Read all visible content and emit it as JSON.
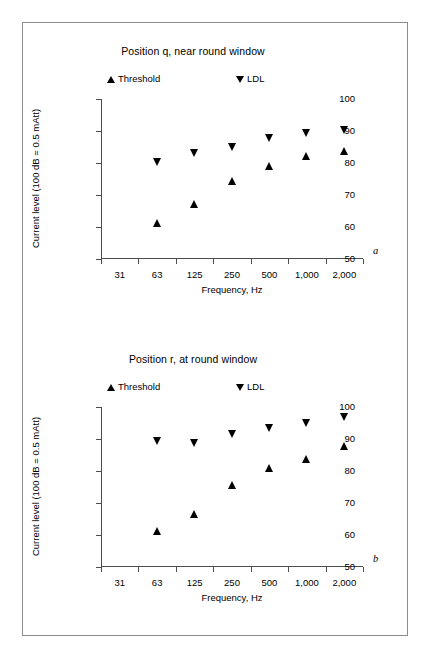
{
  "figure": {
    "background": "#ffffff",
    "frame_color": "#8c8c8c",
    "marker_color": "#000000"
  },
  "panels": [
    {
      "letter": "a",
      "title": "Position q, near round window",
      "legend": {
        "threshold": "Threshold",
        "ldl": "LDL"
      }
    },
    {
      "letter": "b",
      "title": "Position r, at round window",
      "legend": {
        "threshold": "Threshold",
        "ldl": "LDL"
      }
    }
  ],
  "axes": {
    "xlabel": "Frequency, Hz",
    "ylabel": "Current level (100 dB = 0.5 mAtt)",
    "xticklabels": [
      "31",
      "63",
      "125",
      "250",
      "500",
      "1,000",
      "2,000"
    ],
    "yticklabels": [
      "100",
      "90",
      "80",
      "70",
      "60",
      "50"
    ]
  },
  "chart_data": [
    {
      "type": "scatter",
      "title": "Position q, near round window",
      "panel_letter": "a",
      "xlabel": "Frequency, Hz",
      "ylabel": "Current level (100 dB = 0.5 mAtt)",
      "categories": [
        "31",
        "63",
        "125",
        "250",
        "500",
        "1,000",
        "2,000"
      ],
      "x": [
        31,
        63,
        125,
        250,
        500,
        1000,
        2000
      ],
      "xscale": "log",
      "ylim": [
        50,
        100
      ],
      "yticks": [
        50,
        60,
        70,
        80,
        90,
        100
      ],
      "grid": false,
      "legend_position": "top",
      "series": [
        {
          "name": "Threshold",
          "marker": "triangle-up",
          "color": "#000000",
          "categories": [
            "63",
            "125",
            "250",
            "500",
            "1,000",
            "2,000"
          ],
          "values": [
            61.4,
            67.1,
            74.3,
            79.1,
            82.2,
            83.9
          ]
        },
        {
          "name": "LDL",
          "marker": "triangle-down",
          "color": "#000000",
          "categories": [
            "63",
            "125",
            "250",
            "500",
            "1,000",
            "2,000"
          ],
          "values": [
            80.2,
            83.2,
            85.1,
            87.9,
            89.3,
            90.4
          ]
        }
      ]
    },
    {
      "type": "scatter",
      "title": "Position r, at round window",
      "panel_letter": "b",
      "xlabel": "Frequency, Hz",
      "ylabel": "Current level (100 dB = 0.5 mAtt)",
      "categories": [
        "31",
        "63",
        "125",
        "250",
        "500",
        "1,000",
        "2,000"
      ],
      "x": [
        31,
        63,
        125,
        250,
        500,
        1000,
        2000
      ],
      "xscale": "log",
      "ylim": [
        50,
        100
      ],
      "yticks": [
        50,
        60,
        70,
        80,
        90,
        100
      ],
      "grid": false,
      "legend_position": "top",
      "series": [
        {
          "name": "Threshold",
          "marker": "triangle-up",
          "color": "#000000",
          "categories": [
            "63",
            "125",
            "250",
            "500",
            "1,000",
            "2,000"
          ],
          "values": [
            61.4,
            66.7,
            75.5,
            81.0,
            83.6,
            87.7
          ]
        },
        {
          "name": "LDL",
          "marker": "triangle-down",
          "color": "#000000",
          "categories": [
            "63",
            "125",
            "250",
            "500",
            "1,000",
            "2,000"
          ],
          "values": [
            89.5,
            88.7,
            91.6,
            93.4,
            94.9,
            96.8
          ]
        }
      ]
    }
  ]
}
